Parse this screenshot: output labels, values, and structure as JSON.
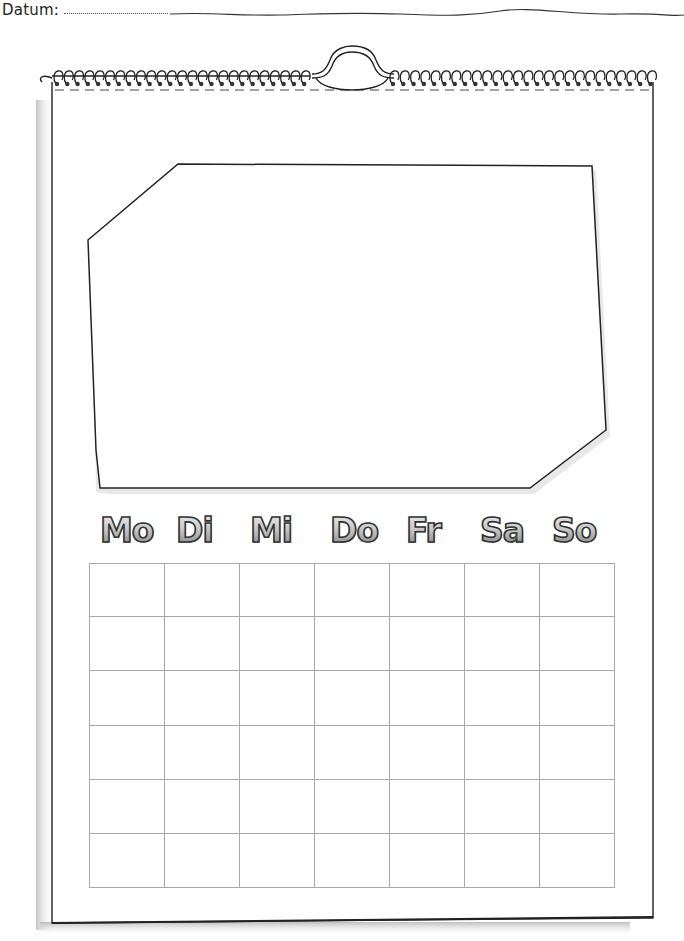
{
  "header": {
    "date_label": "Datum:",
    "date_value": ""
  },
  "calendar": {
    "photo_frame": "empty",
    "weekdays": [
      {
        "label": "Mo"
      },
      {
        "label": "Di"
      },
      {
        "label": "Mi"
      },
      {
        "label": "Do"
      },
      {
        "label": "Fr"
      },
      {
        "label": "Sa"
      },
      {
        "label": "So"
      }
    ],
    "grid": {
      "columns": 7,
      "rows": 6,
      "cells": [
        [
          "",
          "",
          "",
          "",
          "",
          "",
          ""
        ],
        [
          "",
          "",
          "",
          "",
          "",
          "",
          ""
        ],
        [
          "",
          "",
          "",
          "",
          "",
          "",
          ""
        ],
        [
          "",
          "",
          "",
          "",
          "",
          "",
          ""
        ],
        [
          "",
          "",
          "",
          "",
          "",
          "",
          ""
        ],
        [
          "",
          "",
          "",
          "",
          "",
          "",
          ""
        ]
      ]
    }
  },
  "colors": {
    "ink": "#222222",
    "grid_line": "#a8a8a8",
    "shadow": "#c8c8c8",
    "paper": "#ffffff"
  }
}
